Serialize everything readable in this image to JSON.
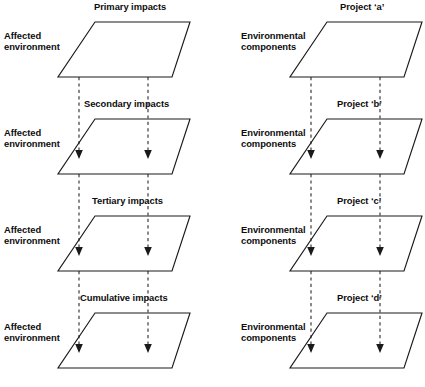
{
  "diagram": {
    "title_hidden": "",
    "columns": [
      {
        "name": "left-column",
        "side_label": "Affected\nenvironment",
        "rows": [
          {
            "id": "primary",
            "title": "Primary impacts"
          },
          {
            "id": "secondary",
            "title": "Secondary impacts"
          },
          {
            "id": "tertiary",
            "title": "Tertiary impacts"
          },
          {
            "id": "cumulative",
            "title": "Cumulative impacts"
          }
        ]
      },
      {
        "name": "right-column",
        "side_label": "Environmental\ncomponents",
        "rows": [
          {
            "id": "project-a",
            "title": "Project ‘a’"
          },
          {
            "id": "project-b",
            "title": "Project ‘b’"
          },
          {
            "id": "project-c",
            "title": "Project ‘c’"
          },
          {
            "id": "project-d",
            "title": "Project ‘d’"
          }
        ]
      }
    ],
    "colors": {
      "stroke": "#1a1a1a",
      "dashed": "#2a2a2a",
      "background": "#ffffff",
      "text": "#0d0d0d"
    }
  }
}
